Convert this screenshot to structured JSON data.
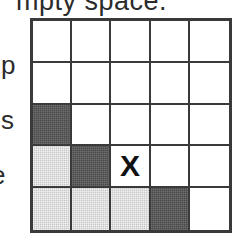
{
  "page": {
    "top_text_fragment": "mpty space.",
    "left_margin_letters": [
      "p",
      "s",
      "e"
    ]
  },
  "grid": {
    "rows": 5,
    "columns": 5,
    "marker_label": "X",
    "colors": {
      "border": "#3a3a3a",
      "empty": "#ffffff",
      "dark_shade": "#4a4a4a",
      "light_shade": "#c8c8c8",
      "marker": "#111111"
    },
    "cells": [
      [
        {
          "fill": "white",
          "label": ""
        },
        {
          "fill": "white",
          "label": ""
        },
        {
          "fill": "white",
          "label": ""
        },
        {
          "fill": "white",
          "label": ""
        },
        {
          "fill": "white",
          "label": ""
        }
      ],
      [
        {
          "fill": "white",
          "label": ""
        },
        {
          "fill": "white",
          "label": ""
        },
        {
          "fill": "white",
          "label": ""
        },
        {
          "fill": "white",
          "label": ""
        },
        {
          "fill": "white",
          "label": ""
        }
      ],
      [
        {
          "fill": "dark",
          "label": ""
        },
        {
          "fill": "white",
          "label": ""
        },
        {
          "fill": "white",
          "label": ""
        },
        {
          "fill": "white",
          "label": ""
        },
        {
          "fill": "white",
          "label": ""
        }
      ],
      [
        {
          "fill": "light",
          "label": ""
        },
        {
          "fill": "dark",
          "label": ""
        },
        {
          "fill": "white",
          "label": "X"
        },
        {
          "fill": "white",
          "label": ""
        },
        {
          "fill": "white",
          "label": ""
        }
      ],
      [
        {
          "fill": "light",
          "label": ""
        },
        {
          "fill": "light",
          "label": ""
        },
        {
          "fill": "light",
          "label": ""
        },
        {
          "fill": "dark",
          "label": ""
        },
        {
          "fill": "white",
          "label": ""
        }
      ]
    ]
  }
}
